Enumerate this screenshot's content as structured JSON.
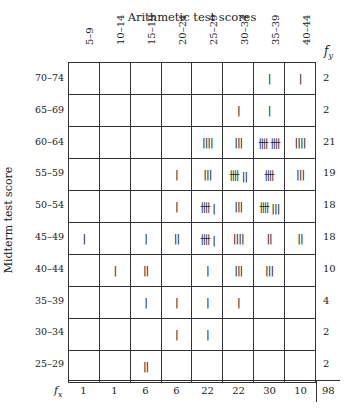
{
  "title": "Arithmetic test scores",
  "y_axis_label": "Midterm test score",
  "fy_label": "f_y",
  "fx_label": "f_x",
  "columns": [
    "5–9",
    "10–14",
    "15–19",
    "20–24",
    "25–29",
    "30–34",
    "35–39",
    "40–44"
  ],
  "rows": [
    {
      "label": "70–74",
      "tallies": [
        "",
        "",
        "",
        "",
        "",
        "",
        "|",
        "|"
      ],
      "fy": "2"
    },
    {
      "label": "65–69",
      "tallies": [
        "",
        "",
        "",
        "",
        "",
        "|",
        "|",
        ""
      ],
      "fy": "2"
    },
    {
      "label": "60–64",
      "tallies": [
        "",
        "",
        "",
        "",
        "||||",
        "|||",
        "卌 卌",
        "||||"
      ],
      "fy": "21"
    },
    {
      "label": "55–59",
      "tallies": [
        "",
        "",
        "",
        "|",
        "|||",
        "卌 ||",
        "卌",
        "|||"
      ],
      "fy": "19"
    },
    {
      "label": "50–54",
      "tallies": [
        "",
        "",
        "",
        "|",
        "卌 |",
        "|||",
        "卌 |||",
        ""
      ],
      "fy": "18"
    },
    {
      "label": "45–49",
      "tallies": [
        "|",
        "",
        "|",
        "||",
        "卌 |",
        "||||",
        "||",
        "||"
      ],
      "fy": "18"
    },
    {
      "label": "40–44",
      "tallies": [
        "",
        "|",
        "||",
        "",
        "|",
        "|||",
        "|||",
        ""
      ],
      "fy": "10"
    },
    {
      "label": "35–39",
      "tallies": [
        "",
        "",
        "|",
        "|",
        "|",
        "|",
        "",
        ""
      ],
      "fy": "4"
    },
    {
      "label": "30–34",
      "tallies": [
        "",
        "",
        "",
        "|",
        "|",
        "",
        "",
        ""
      ],
      "fy": "2"
    },
    {
      "label": "25–29",
      "tallies": [
        "",
        "",
        "||",
        "",
        "",
        "",
        "",
        ""
      ],
      "fy": "2"
    }
  ],
  "fx": [
    "1",
    "1",
    "6",
    "6",
    "22",
    "22",
    "30",
    "10"
  ],
  "total": "98",
  "chart_data": {
    "type": "table",
    "title": "Arithmetic test scores",
    "xlabel": "Arithmetic test scores",
    "ylabel": "Midterm test score",
    "categories": [
      "5–9",
      "10–14",
      "15–19",
      "20–24",
      "25–29",
      "30–34",
      "35–39",
      "40–44"
    ],
    "row_labels": [
      "70–74",
      "65–69",
      "60–64",
      "55–59",
      "50–54",
      "45–49",
      "40–44",
      "35–39",
      "30–34",
      "25–29"
    ],
    "counts": [
      [
        0,
        0,
        0,
        0,
        0,
        0,
        1,
        1
      ],
      [
        0,
        0,
        0,
        0,
        0,
        1,
        1,
        0
      ],
      [
        0,
        0,
        0,
        0,
        4,
        3,
        10,
        4
      ],
      [
        0,
        0,
        0,
        1,
        3,
        7,
        5,
        3
      ],
      [
        0,
        0,
        0,
        1,
        6,
        3,
        8,
        0
      ],
      [
        1,
        0,
        1,
        2,
        6,
        4,
        2,
        2
      ],
      [
        0,
        1,
        2,
        0,
        1,
        3,
        3,
        0
      ],
      [
        0,
        0,
        1,
        1,
        1,
        1,
        0,
        0
      ],
      [
        0,
        0,
        0,
        1,
        1,
        0,
        0,
        0
      ],
      [
        0,
        0,
        2,
        0,
        0,
        0,
        0,
        0
      ]
    ],
    "row_totals_fy": [
      2,
      2,
      21,
      19,
      18,
      18,
      10,
      4,
      2,
      2
    ],
    "col_totals_fx": [
      1,
      1,
      6,
      6,
      22,
      22,
      30,
      10
    ],
    "grand_total": 98
  }
}
